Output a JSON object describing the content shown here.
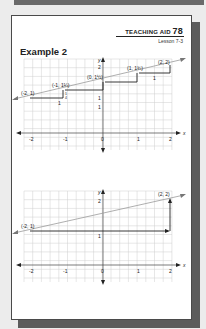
{
  "header": {
    "teaching_aid_label": "TEACHING AID",
    "teaching_aid_number": "78",
    "lesson": "Lesson 7-3"
  },
  "example_title": "Example 2",
  "colors": {
    "grid": "#c8c8c8",
    "axis": "#444444",
    "line": "#9a9a9a",
    "arrow": "#222222",
    "shadow": "#5c5c5c"
  },
  "graph1": {
    "x_axis_label": "x",
    "y_axis_label": "y",
    "x_ticks": [
      "-2",
      "-1",
      "0",
      "1",
      "2"
    ],
    "y_ticks": [
      "1",
      "2"
    ],
    "points": [
      {
        "label": "(-2, 1)",
        "x": -2,
        "y": 1
      },
      {
        "label": "(-1, 1¼)",
        "x": -1,
        "y": 1.25
      },
      {
        "label": "(0, 1½)",
        "x": 0,
        "y": 1.5
      },
      {
        "label": "(1, 1¾)",
        "x": 1,
        "y": 1.75
      },
      {
        "label": "(2, 2)",
        "x": 2,
        "y": 2
      }
    ],
    "run_label": "1",
    "rise_label_num": "1",
    "rise_label_den": "4"
  },
  "graph2": {
    "x_axis_label": "x",
    "y_axis_label": "y",
    "x_ticks": [
      "-2",
      "-1",
      "0",
      "1",
      "2"
    ],
    "y_ticks": [
      "1",
      "2"
    ],
    "points": [
      {
        "label": "(-2, 1)",
        "x": -2,
        "y": 1
      },
      {
        "label": "(2, 2)",
        "x": 2,
        "y": 2
      }
    ]
  }
}
